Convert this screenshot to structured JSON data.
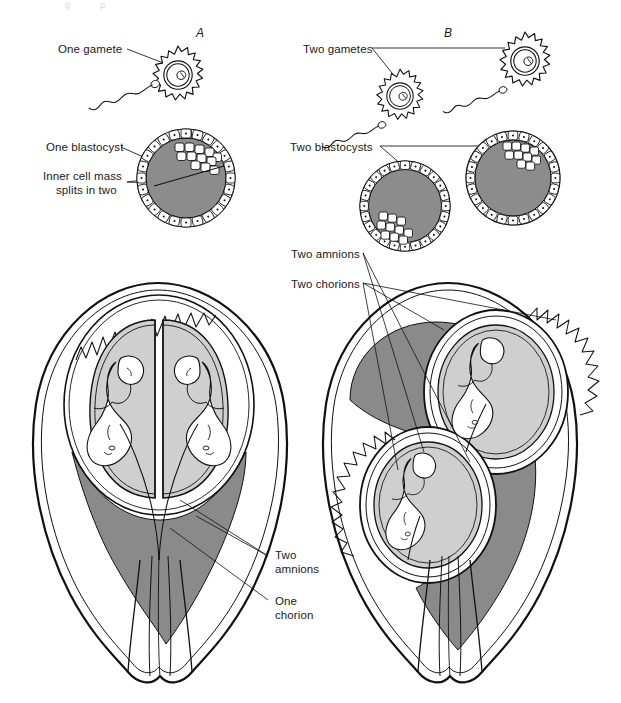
{
  "figure": {
    "top_cut_text": "                  g            p",
    "panels": [
      {
        "id": "A",
        "letter": "A",
        "x": 196,
        "y": 26
      },
      {
        "id": "B",
        "letter": "B",
        "x": 444,
        "y": 26
      }
    ]
  },
  "labels": {
    "one_gamete": "One gamete",
    "one_blastocyst": "One blastocyst",
    "inner_cell_mass_line1": "Inner cell mass",
    "inner_cell_mass_line2": "splits in two",
    "two_gametes": "Two gametes",
    "two_blastocysts": "Two blastocysts",
    "two_amnions_top": "Two amnions",
    "two_chorions_top": "Two chorions",
    "two_amnions_bottom_line1": "Two",
    "two_amnions_bottom_line2": "amnions",
    "one_chorion_line1": "One",
    "one_chorion_line2": "chorion"
  },
  "colors": {
    "ink": "#111111",
    "inner_cell_mass_gray": "#8c8c8c",
    "chorion_dark_gray": "#8a8a8a",
    "amnion_light_gray": "#cfcfcf",
    "fetus_fill": "#ffffff",
    "background": "#ffffff"
  },
  "structures": {
    "panel_a": {
      "title": "Monozygotic (identical) twins",
      "gamete_count": 1,
      "blastocyst_count": 1,
      "amnion_count": 2,
      "chorion_count": 1,
      "fetus_count": 2
    },
    "panel_b": {
      "title": "Dizygotic (fraternal) twins",
      "gamete_count": 2,
      "blastocyst_count": 2,
      "amnion_count": 2,
      "chorion_count": 2,
      "fetus_count": 2
    }
  }
}
